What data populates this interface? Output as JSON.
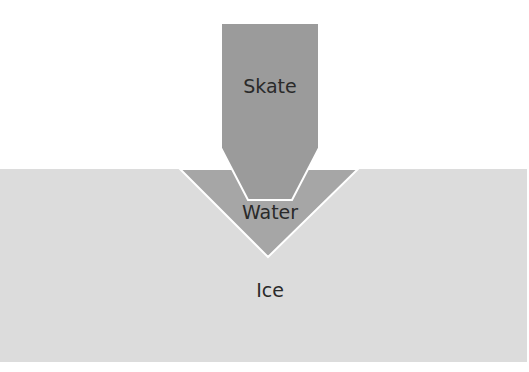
{
  "diagram": {
    "labels": {
      "skate": "Skate",
      "water": "Water",
      "ice": "Ice"
    },
    "colors": {
      "background": "#ffffff",
      "ice": "#dcdcdc",
      "water": "#a6a6a6",
      "skate": "#9b9b9b",
      "outline": "#ffffff",
      "text": "#2a2a2a"
    }
  }
}
